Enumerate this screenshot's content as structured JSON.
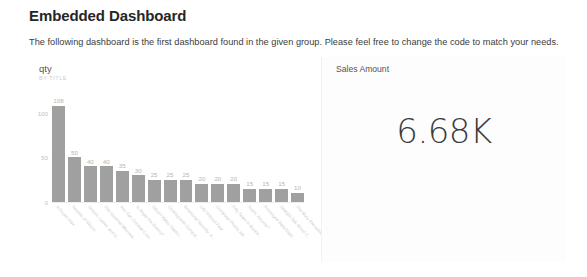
{
  "header": {
    "title": "Embedded Dashboard",
    "description": "The following dashboard is the first dashboard found in the given group. Please feel free to change the code to match your needs."
  },
  "dashboard": {
    "tiles": [
      {
        "type": "bar-chart",
        "title": "qty",
        "subtitle": "BY TITLE"
      },
      {
        "type": "card",
        "title": "Sales Amount",
        "value": "6.68K"
      }
    ]
  },
  "chart_data": {
    "type": "bar",
    "title": "qty",
    "subtitle": "BY TITLE",
    "xlabel": "",
    "ylabel": "",
    "ylim": [
      0,
      120
    ],
    "yticks": [
      0,
      50,
      100
    ],
    "ytick_labels": [
      "0",
      "50",
      "100"
    ],
    "grid": false,
    "legend": false,
    "bar_color": "#a0a0a0",
    "categories": [
      "A Dozen Wax",
      "Secrets of Silicon",
      "Onions, Leeks, and G...",
      "The Gourmet Microwa...",
      "You Can Combat Com...",
      "Is Anger the Enemy?",
      "Silicon Valley Gastro...",
      "Cooking with Comput...",
      "Emotional Security: A ...",
      "Life Without Fear",
      "Computer Phobic AN...",
      "Fifty Years in Buckin...",
      "Sushi, Anyone?",
      "Prolonged Data Depri...",
      "Straight Talk About C...",
      "The Busy Executive's ..."
    ],
    "values": [
      108,
      50,
      40,
      40,
      35,
      30,
      25,
      25,
      25,
      20,
      20,
      20,
      15,
      15,
      15,
      10
    ],
    "data_labels": [
      "108",
      "50",
      "40",
      "40",
      "35",
      "30",
      "25",
      "25",
      "25",
      "20",
      "20",
      "20",
      "15",
      "15",
      "15",
      "10"
    ]
  },
  "card_data": {
    "type": "kpi",
    "label": "Sales Amount",
    "value": "6.68K"
  }
}
